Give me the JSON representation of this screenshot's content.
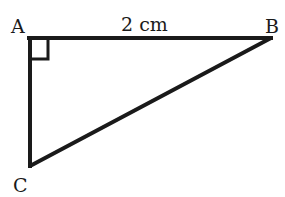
{
  "diagram": {
    "type": "right-triangle",
    "vertices": {
      "A": {
        "label": "A",
        "x": 29,
        "y": 38
      },
      "B": {
        "label": "B",
        "x": 271,
        "y": 38
      },
      "C": {
        "label": "C",
        "x": 30,
        "y": 166
      }
    },
    "right_angle_at": "A",
    "side_labels": {
      "AB": "2 cm"
    },
    "colors": {
      "stroke": "#1a1a1a",
      "background": "#ffffff"
    }
  }
}
